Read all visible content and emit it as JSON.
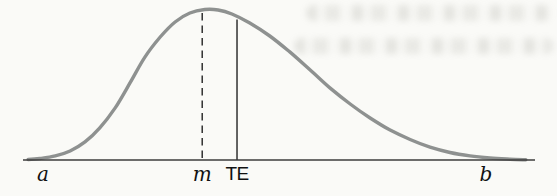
{
  "figure": {
    "kind": "probability-distribution-diagram",
    "paper_color": "#fafaf7",
    "curve_color": "#8e9190",
    "axis_color": "#3d3d3d",
    "marker_line_color": "#222222",
    "label_color": "#111111"
  },
  "chart_data": {
    "type": "line",
    "title": "",
    "xlabel": "",
    "ylabel": "",
    "grid": false,
    "legend": false,
    "x_range": [
      0,
      1
    ],
    "y_range": [
      0,
      1
    ],
    "curve": {
      "x": [
        0.01,
        0.033,
        0.063,
        0.092,
        0.121,
        0.15,
        0.18,
        0.209,
        0.238,
        0.268,
        0.297,
        0.326,
        0.355,
        0.381,
        0.408,
        0.443,
        0.482,
        0.521,
        0.561,
        0.6,
        0.639,
        0.678,
        0.717,
        0.756,
        0.795,
        0.834,
        0.873,
        0.912,
        0.951,
        0.982
      ],
      "y": [
        0.003,
        0.01,
        0.027,
        0.06,
        0.12,
        0.213,
        0.346,
        0.512,
        0.684,
        0.817,
        0.917,
        0.977,
        1.0,
        0.997,
        0.97,
        0.91,
        0.824,
        0.718,
        0.598,
        0.478,
        0.372,
        0.279,
        0.199,
        0.136,
        0.086,
        0.05,
        0.027,
        0.013,
        0.005,
        0.001
      ]
    },
    "annotations": [
      {
        "label": "a",
        "x": 0.039,
        "vline": "none"
      },
      {
        "label": "m",
        "x": 0.35,
        "vline": "dashed"
      },
      {
        "label": "TE",
        "x": 0.418,
        "vline": "solid"
      },
      {
        "label": "b",
        "x": 0.904,
        "vline": "none"
      }
    ]
  }
}
